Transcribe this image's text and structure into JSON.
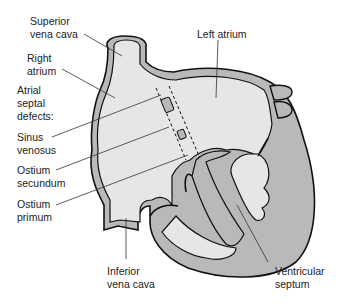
{
  "diagram": {
    "colors": {
      "wall": "#b9b9b9",
      "chamber": "#e6e6e6",
      "outline": "#111111",
      "leader": "#333333",
      "text": "#222222"
    },
    "labels": {
      "superior_vena_cava": [
        "Superior",
        "vena cava"
      ],
      "right_atrium": [
        "Right",
        "atrium"
      ],
      "atrial_septal_defects": [
        "Atrial",
        "septal",
        "defects:"
      ],
      "sinus_venosus": [
        "Sinus",
        "venosus"
      ],
      "ostium_secundum": [
        "Ostium",
        "secundum"
      ],
      "ostium_primum": [
        "Ostium",
        "primum"
      ],
      "inferior_vena_cava": [
        "Inferior",
        "vena cava"
      ],
      "left_atrium": [
        "Left atrium"
      ],
      "ventricular_septum": [
        "Ventricular",
        "septum"
      ]
    }
  }
}
